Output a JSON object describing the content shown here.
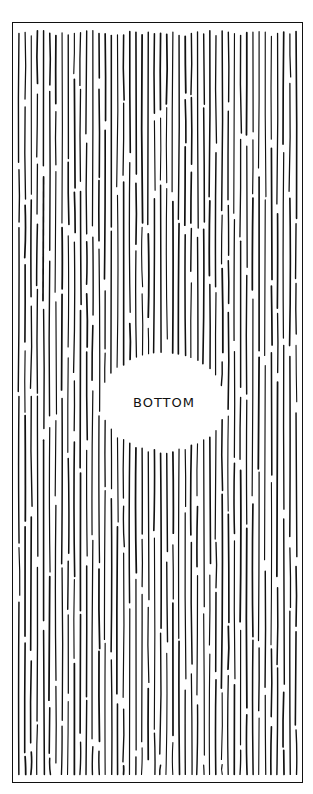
{
  "panel": {
    "label": "BOTTOM",
    "style": "hand-drawn vertical hatching",
    "border_color": "#111111",
    "background_color": "#ffffff",
    "ink_color": "#111111"
  }
}
